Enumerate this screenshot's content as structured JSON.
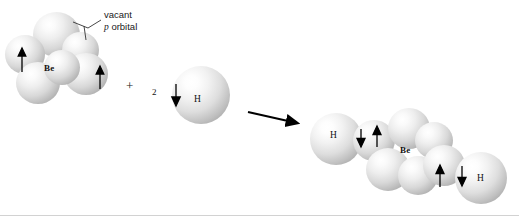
{
  "diagram": {
    "type": "orbital-hybridization-reaction",
    "background_color": "#ffffff",
    "sphere_color": "#d8d8d8",
    "text_color": "#111111",
    "rule_color": "#d2d2d2"
  },
  "annotations": {
    "vacant_line1": "vacant",
    "vacant_p": "p",
    "vacant_line2": "orbital"
  },
  "reactants": {
    "beryllium": {
      "label": "Be",
      "electron_arrows": [
        {
          "name": "spin-up-left",
          "direction": "up"
        },
        {
          "name": "spin-up-right",
          "direction": "up"
        }
      ]
    },
    "plus_sign": "+",
    "hydrogen": {
      "coefficient": "2",
      "label": "H",
      "electron_arrow": {
        "name": "spin-down",
        "direction": "down"
      }
    }
  },
  "reaction_arrow": {
    "name": "reaction-arrow",
    "direction": "right"
  },
  "product": {
    "formula_label": "Be",
    "hydrogen_left_label": "H",
    "hydrogen_right_label": "H",
    "bond_left_arrows": [
      {
        "name": "spin-down",
        "direction": "down"
      },
      {
        "name": "spin-up",
        "direction": "up"
      }
    ],
    "bond_right_arrows": [
      {
        "name": "spin-up",
        "direction": "up"
      },
      {
        "name": "spin-down",
        "direction": "down"
      }
    ]
  }
}
